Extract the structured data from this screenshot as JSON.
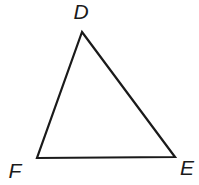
{
  "diagram": {
    "type": "triangle",
    "stroke_color": "#1a1a1a",
    "background_color": "#ffffff",
    "vertices": [
      {
        "name": "D",
        "x": 82,
        "y": 32,
        "label": "D",
        "label_x": 81,
        "label_y": 19
      },
      {
        "name": "E",
        "x": 175,
        "y": 157,
        "label": "E",
        "label_x": 187,
        "label_y": 175
      },
      {
        "name": "F",
        "x": 37,
        "y": 158,
        "label": "F",
        "label_x": 15,
        "label_y": 178
      }
    ],
    "sides": [
      "DE",
      "EF",
      "FD"
    ]
  }
}
